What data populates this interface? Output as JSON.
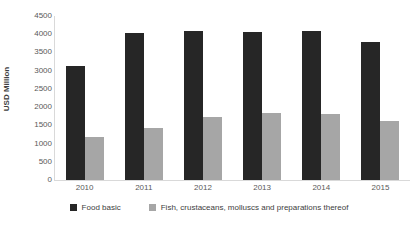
{
  "chart_data": {
    "type": "bar",
    "title": "",
    "xlabel": "",
    "ylabel": "USD Million",
    "ylim": [
      0,
      4500
    ],
    "yticks": [
      4500,
      4000,
      3500,
      3000,
      2500,
      2000,
      1500,
      1000,
      500,
      0
    ],
    "grid": false,
    "legend_position": "bottom",
    "categories": [
      "2010",
      "2011",
      "2012",
      "2013",
      "2014",
      "2015"
    ],
    "series": [
      {
        "name": "Food basic",
        "color": "#262626",
        "values": [
          3130,
          4030,
          4090,
          4060,
          4090,
          3790
        ]
      },
      {
        "name": "Fish, crustaceans, molluscs and preparations thereof",
        "color": "#a6a6a6",
        "values": [
          1180,
          1430,
          1730,
          1840,
          1810,
          1620
        ]
      }
    ]
  }
}
